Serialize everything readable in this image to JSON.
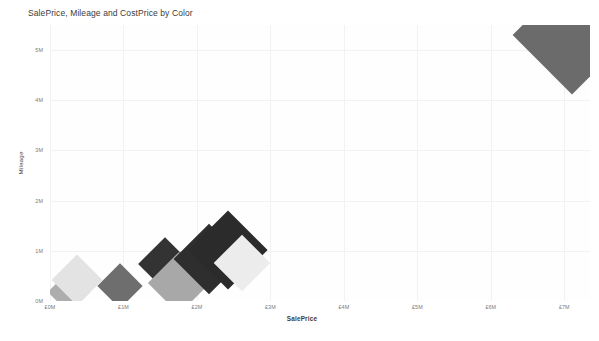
{
  "chart_data": {
    "type": "scatter",
    "title": "SalePrice, Mileage and CostPrice by Color",
    "xlabel": "SalePrice",
    "ylabel": "Mileage",
    "xlim": [
      0,
      7.35
    ],
    "ylim": [
      0,
      5.5
    ],
    "grid": true,
    "legend": "none",
    "marker_shape": "diamond",
    "size_encoding": "CostPrice",
    "color_encoding": "Color",
    "x_ticks": [
      {
        "value": 0,
        "label": "£0M"
      },
      {
        "value": 1,
        "label": "£1M"
      },
      {
        "value": 2,
        "label": "£2M"
      },
      {
        "value": 3,
        "label": "£3M"
      },
      {
        "value": 4,
        "label": "£4M"
      },
      {
        "value": 5,
        "label": "£5M"
      },
      {
        "value": 6,
        "label": "£6M"
      },
      {
        "value": 7,
        "label": "£7M"
      }
    ],
    "y_ticks": [
      {
        "value": 0,
        "label": "0M"
      },
      {
        "value": 1,
        "label": "1M"
      },
      {
        "value": 2,
        "label": "2M"
      },
      {
        "value": 3,
        "label": "3M"
      },
      {
        "value": 4,
        "label": "4M"
      },
      {
        "value": 5,
        "label": "5M"
      }
    ],
    "points": [
      {
        "x": 0.26,
        "y": 0.18,
        "size": 30,
        "color": "#adadad"
      },
      {
        "x": 0.37,
        "y": 0.41,
        "size": 36,
        "color": "#e3e3e3"
      },
      {
        "x": 0.95,
        "y": 0.3,
        "size": 32,
        "color": "#6e6e6e"
      },
      {
        "x": 1.57,
        "y": 0.74,
        "size": 38,
        "color": "#333333"
      },
      {
        "x": 1.75,
        "y": 0.36,
        "size": 44,
        "color": "#a8a8a8"
      },
      {
        "x": 2.16,
        "y": 0.84,
        "size": 50,
        "color": "#2e2e2e"
      },
      {
        "x": 2.42,
        "y": 1.02,
        "size": 56,
        "color": "#2b2b2b"
      },
      {
        "x": 2.61,
        "y": 0.76,
        "size": 40,
        "color": "#ececec"
      },
      {
        "x": 7.1,
        "y": 5.3,
        "size": 84,
        "color": "#6b6b6b"
      }
    ]
  }
}
